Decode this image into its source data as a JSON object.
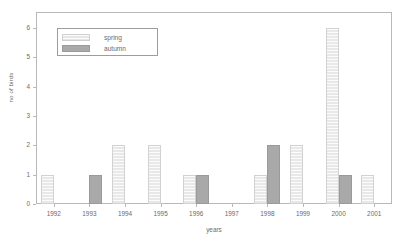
{
  "chart_data": {
    "type": "bar",
    "title": "",
    "subtitle": "",
    "xlabel": "years",
    "ylabel": "no of birds",
    "categories": [
      "1992",
      "1993",
      "1994",
      "1995",
      "1996",
      "1997",
      "1998",
      "1999",
      "2000",
      "2001"
    ],
    "series": [
      {
        "name": "spring",
        "color": "#e8e8e8",
        "values": [
          1,
          0,
          2,
          2,
          1,
          0,
          1,
          2,
          6,
          1
        ]
      },
      {
        "name": "autumn",
        "color": "#a9a9a9",
        "values": [
          0,
          1,
          0,
          0,
          1,
          0,
          2,
          0,
          1,
          0
        ]
      }
    ],
    "ylim": [
      0,
      6
    ],
    "yticks": [
      0,
      1,
      2,
      3,
      4,
      5,
      6
    ],
    "ytick_labels": [
      "0",
      "1",
      "2",
      "3",
      "4",
      "5",
      "6"
    ],
    "grid": false,
    "legend_position": "upper-left",
    "legend_entries": [
      "spring",
      "autumn"
    ],
    "annotations": []
  },
  "axes": {
    "y_title": "no of birds",
    "x_title": "years"
  },
  "legend": {
    "items": [
      {
        "label": "spring",
        "swatch": "spring-swatch"
      },
      {
        "label": "autumn",
        "swatch": "autumn-swatch"
      }
    ]
  }
}
